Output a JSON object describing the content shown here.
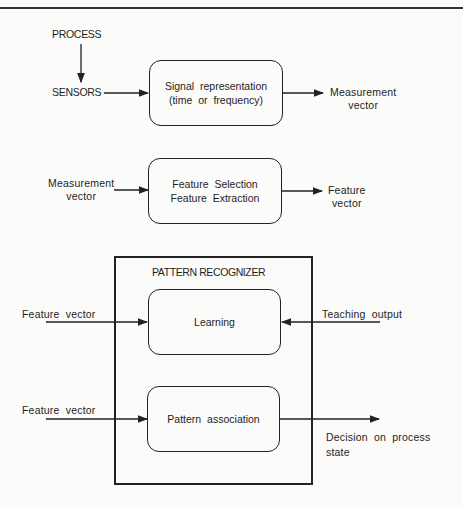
{
  "diagram": {
    "stage1": {
      "source": "PROCESS",
      "input": "SENSORS",
      "box_line1": "Signal  representation",
      "box_line2": "(time  or  frequency)",
      "output_line1": "Measurement",
      "output_line2": "vector"
    },
    "stage2": {
      "input_line1": "Measurement",
      "input_line2": "vector",
      "box_line1": "Feature  Selection",
      "box_line2": "Feature  Extraction",
      "output_line1": "Feature",
      "output_line2": "vector"
    },
    "stage3": {
      "container_title": "PATTERN RECOGNIZER",
      "learning": {
        "input": "Feature  vector",
        "box": "Learning",
        "teaching": "Teaching  output"
      },
      "association": {
        "input": "Feature  vector",
        "box": "Pattern  association",
        "output_line1": "Decision  on  process",
        "output_line2": "state"
      }
    }
  }
}
